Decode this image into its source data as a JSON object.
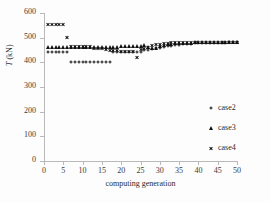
{
  "chart_data": {
    "type": "scatter",
    "title": "",
    "xlabel": "computing generation",
    "ylabel": "T (kN)",
    "ylabel_italic_part": "T",
    "ylabel_rest": " (kN)",
    "xlim": [
      0,
      50
    ],
    "ylim": [
      0,
      600
    ],
    "xticks": [
      0,
      5,
      10,
      15,
      20,
      25,
      30,
      35,
      40,
      45,
      50
    ],
    "yticks": [
      0,
      100,
      200,
      300,
      400,
      500,
      600
    ],
    "grid": false,
    "legend_position": "right",
    "marker_color": "#111111",
    "series": [
      {
        "name": "case2",
        "marker": "circle",
        "x": [
          1,
          2,
          3,
          4,
          5,
          6,
          7,
          8,
          9,
          10,
          11,
          12,
          13,
          14,
          15,
          16,
          17,
          18,
          19,
          20,
          21,
          22,
          23,
          24,
          25,
          26,
          27,
          28,
          29,
          30,
          31,
          32,
          33,
          34,
          35,
          36,
          37,
          38,
          39,
          40,
          41,
          42,
          43,
          44,
          45,
          46,
          47,
          48,
          49,
          50
        ],
        "values": [
          440,
          440,
          440,
          440,
          440,
          440,
          400,
          400,
          400,
          400,
          400,
          400,
          400,
          400,
          400,
          400,
          400,
          440,
          440,
          440,
          440,
          440,
          440,
          440,
          443,
          450,
          452,
          455,
          458,
          460,
          462,
          465,
          468,
          470,
          472,
          474,
          475,
          476,
          477,
          478,
          478,
          479,
          479,
          480,
          480,
          480,
          480,
          481,
          481,
          481
        ]
      },
      {
        "name": "case3",
        "marker": "triangle",
        "x": [
          1,
          2,
          3,
          4,
          5,
          6,
          7,
          8,
          9,
          10,
          11,
          12,
          13,
          14,
          15,
          16,
          17,
          18,
          19,
          20,
          21,
          22,
          23,
          24,
          25,
          26,
          27,
          28,
          29,
          30,
          31,
          32,
          33,
          34,
          35,
          36,
          37,
          38,
          39,
          40,
          41,
          42,
          43,
          44,
          45,
          46,
          47,
          48,
          49,
          50
        ],
        "values": [
          462,
          463,
          463,
          463,
          463,
          463,
          463,
          463,
          463,
          463,
          463,
          463,
          463,
          463,
          463,
          463,
          463,
          463,
          464,
          466,
          468,
          466,
          465,
          465,
          468,
          470,
          462,
          458,
          460,
          468,
          472,
          474,
          476,
          478,
          479,
          480,
          480,
          480,
          481,
          481,
          481,
          481,
          482,
          482,
          482,
          482,
          482,
          482,
          482,
          482
        ]
      },
      {
        "name": "case4",
        "marker": "cross",
        "x": [
          1,
          2,
          3,
          4,
          5,
          6,
          7,
          8,
          9,
          10,
          11,
          12,
          13,
          14,
          15,
          16,
          17,
          18,
          19,
          20,
          21,
          22,
          23,
          24,
          25,
          26,
          27,
          28,
          29,
          30,
          31,
          32,
          33,
          34,
          35,
          36,
          37,
          38,
          39,
          40,
          41,
          42,
          43,
          44,
          45,
          46,
          47,
          48,
          49,
          50
        ],
        "values": [
          553,
          553,
          553,
          553,
          553,
          500,
          463,
          463,
          463,
          463,
          463,
          463,
          458,
          456,
          455,
          452,
          450,
          447,
          446,
          445,
          445,
          444,
          444,
          420,
          452,
          455,
          462,
          470,
          472,
          474,
          476,
          478,
          479,
          480,
          481,
          481,
          481,
          481,
          482,
          482,
          482,
          482,
          482,
          482,
          482,
          482,
          482,
          482,
          482,
          482
        ]
      }
    ],
    "legend": [
      {
        "label": "case2",
        "marker": "circle"
      },
      {
        "label": "case3",
        "marker": "triangle"
      },
      {
        "label": "case4",
        "marker": "cross"
      }
    ]
  }
}
